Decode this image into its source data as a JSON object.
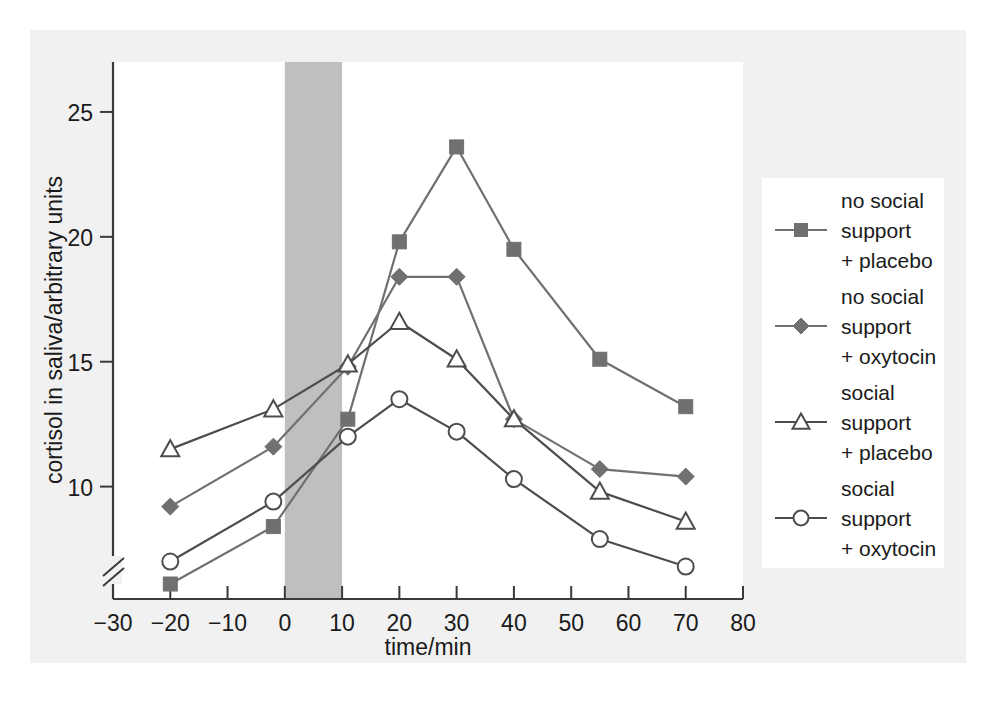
{
  "chart_data": {
    "type": "line",
    "title": "",
    "xlabel": "time/min",
    "ylabel": "cortisol in saliva/arbitrary units",
    "xlim": [
      -30,
      80
    ],
    "ylim": [
      5.5,
      27
    ],
    "xticks": [
      -30,
      -20,
      -10,
      0,
      10,
      20,
      30,
      40,
      50,
      60,
      70,
      80
    ],
    "xtick_labels": [
      "−30",
      "−20",
      "−10",
      "0",
      "10",
      "20",
      "30",
      "40",
      "50",
      "60",
      "70",
      "80"
    ],
    "yticks": [
      10,
      15,
      20,
      25
    ],
    "ytick_labels": [
      "10",
      "15",
      "20",
      "25"
    ],
    "y_axis_break": true,
    "grid": false,
    "legend_position": "right",
    "annotations": [
      {
        "type": "shaded-band",
        "name": "stress-task-band",
        "x_start": 0,
        "x_end": 10,
        "color": "#bfbfbf"
      }
    ],
    "series": [
      {
        "name": "no social support + placebo",
        "label_lines": [
          "no social",
          "support",
          "+ placebo"
        ],
        "marker": "filled-square",
        "color": "#707070",
        "x": [
          -20,
          -2,
          11,
          20,
          30,
          40,
          55,
          70
        ],
        "y": [
          6.1,
          8.4,
          12.7,
          19.8,
          23.6,
          19.5,
          15.1,
          13.2
        ]
      },
      {
        "name": "no social support + oxytocin",
        "label_lines": [
          "no social",
          "support",
          "+ oxytocin"
        ],
        "marker": "filled-diamond",
        "color": "#707070",
        "x": [
          -20,
          -2,
          11,
          20,
          30,
          40,
          55,
          70
        ],
        "y": [
          9.2,
          11.6,
          14.8,
          18.4,
          18.4,
          12.7,
          10.7,
          10.4
        ]
      },
      {
        "name": "social support + placebo",
        "label_lines": [
          "social",
          "support",
          "+ placebo"
        ],
        "marker": "open-triangle",
        "color": "#4d4d4d",
        "x": [
          -20,
          -2,
          11,
          20,
          30,
          40,
          55,
          70
        ],
        "y": [
          11.5,
          13.1,
          14.9,
          16.6,
          15.1,
          12.7,
          9.8,
          8.6
        ]
      },
      {
        "name": "social support + oxytocin",
        "label_lines": [
          "social",
          "support",
          "+ oxytocin"
        ],
        "marker": "open-circle",
        "color": "#4d4d4d",
        "x": [
          -20,
          -2,
          11,
          20,
          30,
          40,
          55,
          70
        ],
        "y": [
          7.0,
          9.4,
          12.0,
          13.5,
          12.2,
          10.3,
          7.9,
          6.8
        ]
      }
    ]
  },
  "legend": {
    "entries": [
      {
        "line1": "no social",
        "line2": "support",
        "line3": "+ placebo"
      },
      {
        "line1": "no social",
        "line2": "support",
        "line3": "+ oxytocin"
      },
      {
        "line1": "social",
        "line2": "support",
        "line3": "+ placebo"
      },
      {
        "line1": "social",
        "line2": "support",
        "line3": "+ oxytocin"
      }
    ]
  },
  "axes": {
    "x_title": "time/min",
    "y_title": "cortisol in saliva/arbitrary units",
    "x_labels": [
      "−30",
      "−20",
      "−10",
      "0",
      "10",
      "20",
      "30",
      "40",
      "50",
      "60",
      "70",
      "80"
    ],
    "y_labels": [
      "25",
      "20",
      "15",
      "10"
    ]
  }
}
